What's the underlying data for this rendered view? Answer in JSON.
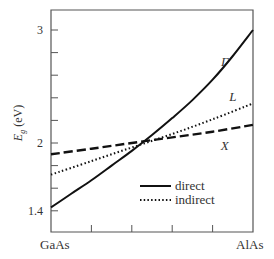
{
  "chart_data": {
    "type": "line",
    "title": "",
    "xlabel": "",
    "ylabel": "E_g (eV)",
    "ylabel_main": "E",
    "ylabel_sub": "g",
    "ylabel_unit": "(eV)",
    "x_range": [
      0,
      1
    ],
    "ylim": [
      1.25,
      3.1
    ],
    "x_endpoint_labels": [
      "GaAs",
      "AlAs"
    ],
    "x_minor_ticks": [
      0.2,
      0.4,
      0.6,
      0.8
    ],
    "y_tick_values": [
      1.4,
      1.6,
      1.8,
      2.0,
      2.2,
      2.4,
      2.6,
      2.8,
      3.0
    ],
    "y_tick_labels": [
      {
        "value": 3.0,
        "label": "3"
      },
      {
        "value": 2.0,
        "label": "2"
      },
      {
        "value": 1.4,
        "label": "1.4"
      }
    ],
    "grid": false,
    "legend_position": "lower right",
    "series": [
      {
        "name": "Γ",
        "style": "direct",
        "dash": "solid",
        "x": [
          0,
          0.1,
          0.2,
          0.3,
          0.4,
          0.5,
          0.6,
          0.7,
          0.8,
          0.9,
          1.0
        ],
        "values": [
          1.43,
          1.55,
          1.67,
          1.8,
          1.93,
          2.07,
          2.22,
          2.38,
          2.56,
          2.77,
          3.0
        ]
      },
      {
        "name": "L",
        "style": "indirect",
        "dash": "dotted",
        "x": [
          0,
          0.2,
          0.4,
          0.6,
          0.8,
          1.0
        ],
        "values": [
          1.72,
          1.84,
          1.96,
          2.08,
          2.21,
          2.35
        ]
      },
      {
        "name": "X",
        "style": "indirect",
        "dash": "dashed",
        "x": [
          0,
          0.2,
          0.4,
          0.6,
          0.8,
          1.0
        ],
        "values": [
          1.9,
          1.95,
          2.0,
          2.05,
          2.1,
          2.16
        ]
      }
    ],
    "annotations": [
      {
        "text": "Γ",
        "x": 0.86,
        "y": 2.68
      },
      {
        "text": "L",
        "x": 0.9,
        "y": 2.37
      },
      {
        "text": "X",
        "x": 0.86,
        "y": 1.94
      }
    ],
    "legend": [
      {
        "label": "direct",
        "dash": "solid"
      },
      {
        "label": "indirect",
        "dash": "dotted"
      }
    ]
  }
}
